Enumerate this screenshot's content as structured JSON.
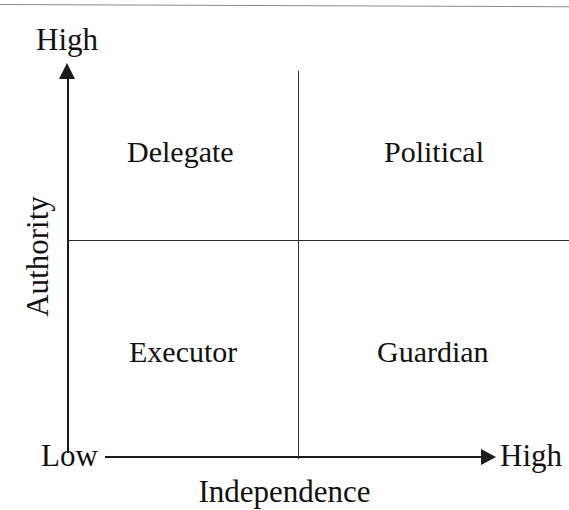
{
  "figure": {
    "type": "2x2-quadrant-matrix",
    "background_color": "#ffffff",
    "line_color": "#1b1b1b",
    "text_color": "#111111",
    "top_rule_color": "#8a8a8a"
  },
  "axes": {
    "y": {
      "label": "Authority",
      "low_label": "Low",
      "high_label": "High",
      "arrow": "up-arrow-icon"
    },
    "x": {
      "label": "Independence",
      "low_label": "Low",
      "high_label": "High",
      "arrow": "right-arrow-icon"
    }
  },
  "quadrants": [
    {
      "position": "top-left",
      "label": "Delegate",
      "authority": "High",
      "independence": "Low"
    },
    {
      "position": "top-right",
      "label": "Political",
      "authority": "High",
      "independence": "High"
    },
    {
      "position": "bottom-left",
      "label": "Executor",
      "authority": "Low",
      "independence": "Low"
    },
    {
      "position": "bottom-right",
      "label": "Guardian",
      "authority": "Low",
      "independence": "High"
    }
  ],
  "chart_data": {
    "type": "table",
    "title": "",
    "xlabel": "Independence",
    "ylabel": "Authority",
    "x_tick_labels": [
      "Low",
      "High"
    ],
    "y_tick_labels": [
      "Low",
      "High"
    ],
    "grid": true,
    "legend": "none",
    "categories": [
      "Low Independence",
      "High Independence"
    ],
    "rows": [
      "High Authority",
      "Low Authority"
    ],
    "cells": [
      [
        "Delegate",
        "Political"
      ],
      [
        "Executor",
        "Guardian"
      ]
    ]
  }
}
